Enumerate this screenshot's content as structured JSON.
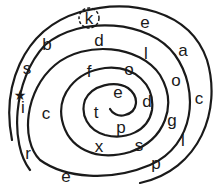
{
  "diagram": {
    "type": "letter-spiral-puzzle",
    "stroke_color": "#1a1a1a",
    "background": "#ffffff",
    "start_marker": {
      "symbol": "★",
      "name": "star",
      "x": 20,
      "y": 95
    },
    "highlighted_letter": {
      "char": "k",
      "style": "dashed-circle",
      "x": 89,
      "y": 18
    },
    "letters": [
      {
        "char": "k",
        "x": 89,
        "y": 18
      },
      {
        "char": "e",
        "x": 145,
        "y": 22
      },
      {
        "char": "b",
        "x": 47,
        "y": 44
      },
      {
        "char": "d",
        "x": 99,
        "y": 40
      },
      {
        "char": "l",
        "x": 146,
        "y": 53
      },
      {
        "char": "a",
        "x": 183,
        "y": 50
      },
      {
        "char": "s",
        "x": 27,
        "y": 68
      },
      {
        "char": "f",
        "x": 89,
        "y": 71
      },
      {
        "char": "o",
        "x": 129,
        "y": 69
      },
      {
        "char": "o",
        "x": 176,
        "y": 80
      },
      {
        "char": "e",
        "x": 118,
        "y": 92
      },
      {
        "char": "i",
        "x": 23,
        "y": 107
      },
      {
        "char": "c",
        "x": 46,
        "y": 113
      },
      {
        "char": "t",
        "x": 96,
        "y": 112
      },
      {
        "char": "d",
        "x": 147,
        "y": 101
      },
      {
        "char": "c",
        "x": 199,
        "y": 98
      },
      {
        "char": "p",
        "x": 121,
        "y": 127
      },
      {
        "char": "g",
        "x": 172,
        "y": 120
      },
      {
        "char": "x",
        "x": 99,
        "y": 146
      },
      {
        "char": "s",
        "x": 139,
        "y": 145
      },
      {
        "char": "l",
        "x": 183,
        "y": 140
      },
      {
        "char": "r",
        "x": 28,
        "y": 153
      },
      {
        "char": "p",
        "x": 156,
        "y": 163
      },
      {
        "char": "e",
        "x": 66,
        "y": 176
      }
    ]
  }
}
